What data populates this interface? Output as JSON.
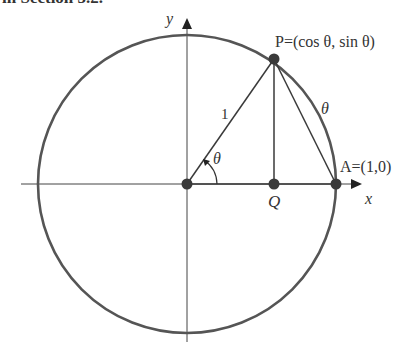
{
  "header": {
    "partial_text": "in Section 5.2."
  },
  "diagram": {
    "axes": {
      "x_label": "x",
      "y_label": "y"
    },
    "labels": {
      "P": "P=(cos θ, sin θ)",
      "A": "A=(1,0)",
      "Q": "Q",
      "radius": "1",
      "arc": "θ",
      "angle": "θ"
    },
    "colors": {
      "circle": "#555555",
      "axis": "#444444",
      "line": "#3a3a3a",
      "point": "#3a3a3a"
    }
  }
}
